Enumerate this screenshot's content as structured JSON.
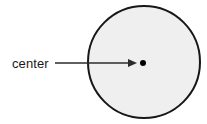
{
  "figure": {
    "kind": "geometry-diagram",
    "canvas": {
      "width": 207,
      "height": 124,
      "background": "#ffffff"
    },
    "labels": [
      {
        "id": "center-label",
        "text": "center",
        "x": 12,
        "y": 68,
        "color": "#1a1a1a",
        "font_size": 13
      }
    ],
    "shapes": {
      "circle": {
        "name": "circle",
        "cx": 144,
        "cy": 62,
        "r": 56,
        "fill": "#efefef",
        "stroke": "#171717",
        "stroke_width": 2
      },
      "center_dot": {
        "name": "center-point",
        "cx": 143,
        "cy": 63,
        "r": 3,
        "fill": "#000000"
      }
    },
    "annotations": {
      "leader_arrow": {
        "name": "leader-arrow",
        "from_x": 55,
        "to_x": 137,
        "y": 63,
        "color": "#2b2b2b",
        "stroke_width": 1.3,
        "arrowhead": {
          "length": 9,
          "half_width": 4
        }
      }
    }
  }
}
